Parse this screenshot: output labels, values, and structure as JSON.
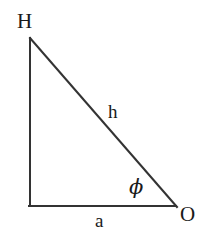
{
  "figure": {
    "type": "right-triangle-geometry-diagram",
    "background_color": "#ffffff",
    "stroke_color": "#333333",
    "text_color": "#1a1a1a",
    "stroke_width": 2,
    "vertices": {
      "apex": {
        "label": "H",
        "x": 30,
        "y": 38
      },
      "right_angle": {
        "label": "",
        "x": 30,
        "y": 206
      },
      "base_right": {
        "label": "O",
        "x": 176,
        "y": 206
      }
    },
    "labels": {
      "vertex_top": "H",
      "vertex_right": "O",
      "hypotenuse": "h",
      "base": "a",
      "angle": "ϕ"
    }
  }
}
